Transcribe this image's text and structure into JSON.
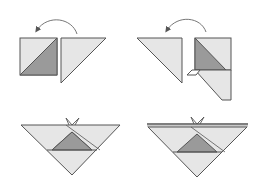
{
  "diagram": {
    "steps": [
      {
        "id": "step-1",
        "description": "Square with diagonal shading beside a right triangle; arrow curves from triangle onto square"
      },
      {
        "id": "step-2",
        "description": "Triangle beside folded square with dark inner triangle and light lower flap; arrow curves leftward"
      },
      {
        "id": "step-3",
        "description": "Inverted triangle with dark center triangle and small V-notch at top"
      },
      {
        "id": "step-4",
        "description": "Inverted triangle with double top edge, dark center triangle and V-notch"
      }
    ],
    "colors": {
      "light_fill": "#e6e6e6",
      "dark_fill": "#9a9a9a",
      "stroke": "#555555",
      "arrow": "#666666",
      "background": "#ffffff"
    }
  }
}
